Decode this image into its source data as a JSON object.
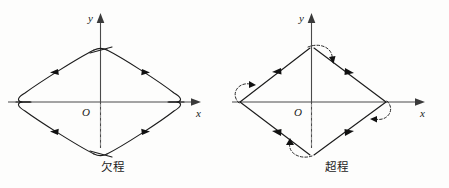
{
  "figure": {
    "background_color": "#fdfdfc",
    "line_color": "#1c1c1c",
    "axis_color": "#4a4a4a"
  },
  "panels": [
    {
      "id": "left",
      "caption": "欠程",
      "caption_meaning": "under-travel",
      "x_axis_label": "x",
      "y_axis_label": "y",
      "origin_label": "O",
      "shape": "rounded-diamond",
      "corner_style": "truncated-rounded",
      "direction": "clockwise-from-top",
      "arrow_count": 4,
      "vertices": [
        {
          "name": "top",
          "x": 0,
          "y": 1
        },
        {
          "name": "left",
          "x": -1,
          "y": 0
        },
        {
          "name": "bottom",
          "x": 0,
          "y": -1
        },
        {
          "name": "right",
          "x": 1,
          "y": 0
        }
      ],
      "overshoot_arcs": 0
    },
    {
      "id": "right",
      "caption": "超程",
      "caption_meaning": "over-travel",
      "x_axis_label": "x",
      "y_axis_label": "y",
      "origin_label": "O",
      "shape": "sharp-diamond",
      "corner_style": "overshoot-loop",
      "direction": "clockwise-from-top",
      "arrow_count": 4,
      "vertices": [
        {
          "name": "top",
          "x": 0,
          "y": 1
        },
        {
          "name": "left",
          "x": -1,
          "y": 0
        },
        {
          "name": "bottom",
          "x": 0,
          "y": -1
        },
        {
          "name": "right",
          "x": 1,
          "y": 0
        }
      ],
      "overshoot_arcs": 4
    }
  ]
}
